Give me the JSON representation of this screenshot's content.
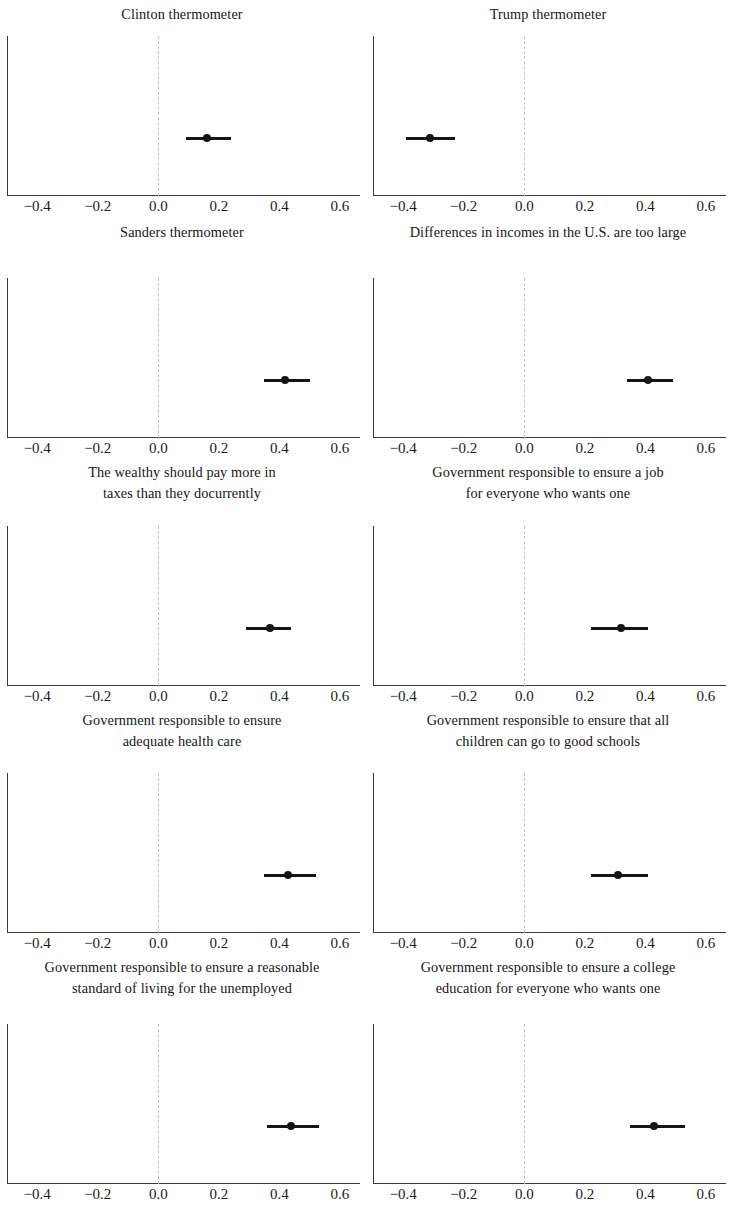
{
  "figure": {
    "layout": {
      "rows": 5,
      "columns": 2,
      "panels": 10
    },
    "axis": {
      "tick_labels": [
        "−0.4",
        "−0.2",
        "0.0",
        "0.2",
        "0.4",
        "0.6"
      ],
      "tick_values": [
        -0.4,
        -0.2,
        0.0,
        0.2,
        0.4,
        0.6
      ],
      "xmin": -0.5,
      "xmax": 0.66,
      "zero_reference": 0.0
    },
    "colors": {
      "point": "#141414",
      "interval": "#141414",
      "axis": "#3a3a3a",
      "zero_line": "#c2c2c2",
      "background": "#ffffff",
      "text": "#161616"
    }
  },
  "chart_data": {
    "type": "scatter",
    "title": "",
    "subtitle": "",
    "xlabel": "",
    "ylabel": "",
    "xlim": [
      -0.5,
      0.66
    ],
    "grid": false,
    "legend": null,
    "xticks": [
      -0.4,
      -0.2,
      0.0,
      0.2,
      0.4,
      0.6
    ],
    "xticklabels": [
      "−0.4",
      "−0.2",
      "0.0",
      "0.2",
      "0.4",
      "0.6"
    ],
    "panels": [
      {
        "title": "Clinton thermometer",
        "title_lines": [
          "Clinton thermometer"
        ],
        "estimate": 0.16,
        "ci_low": 0.09,
        "ci_high": 0.24
      },
      {
        "title": "Trump thermometer",
        "title_lines": [
          "Trump thermometer"
        ],
        "estimate": -0.31,
        "ci_low": -0.39,
        "ci_high": -0.23
      },
      {
        "title": "Sanders thermometer",
        "title_lines": [
          "Sanders thermometer"
        ],
        "estimate": 0.42,
        "ci_low": 0.35,
        "ci_high": 0.5
      },
      {
        "title": "Differences in incomes in the U.S. are too large",
        "title_lines": [
          "Differences in incomes in the U.S. are too large"
        ],
        "estimate": 0.41,
        "ci_low": 0.34,
        "ci_high": 0.49
      },
      {
        "title": "The wealthy should pay more in taxes than they docurrently",
        "title_lines": [
          "The wealthy should pay more in",
          "taxes than they docurrently"
        ],
        "estimate": 0.37,
        "ci_low": 0.29,
        "ci_high": 0.44
      },
      {
        "title": "Government responsible to ensure a job for everyone who wants one",
        "title_lines": [
          "Government responsible to ensure a job",
          "for everyone who wants one"
        ],
        "estimate": 0.32,
        "ci_low": 0.22,
        "ci_high": 0.41
      },
      {
        "title": "Government responsible to ensure adequate health care",
        "title_lines": [
          "Government responsible to ensure",
          "adequate health care"
        ],
        "estimate": 0.43,
        "ci_low": 0.35,
        "ci_high": 0.52
      },
      {
        "title": "Government responsible to ensure that all children can go to good schools",
        "title_lines": [
          "Government responsible to ensure that all",
          "children can go to good schools"
        ],
        "estimate": 0.31,
        "ci_low": 0.22,
        "ci_high": 0.41
      },
      {
        "title": "Government responsible to ensure a reasonable standard of living for the unemployed",
        "title_lines": [
          "Government responsible to ensure a reasonable",
          "standard of living for the unemployed"
        ],
        "estimate": 0.44,
        "ci_low": 0.36,
        "ci_high": 0.53
      },
      {
        "title": "Government responsible to ensure a college education for everyone who wants one",
        "title_lines": [
          "Government responsible to ensure a college",
          "education for everyone who wants one"
        ],
        "estimate": 0.43,
        "ci_low": 0.35,
        "ci_high": 0.53
      }
    ]
  }
}
